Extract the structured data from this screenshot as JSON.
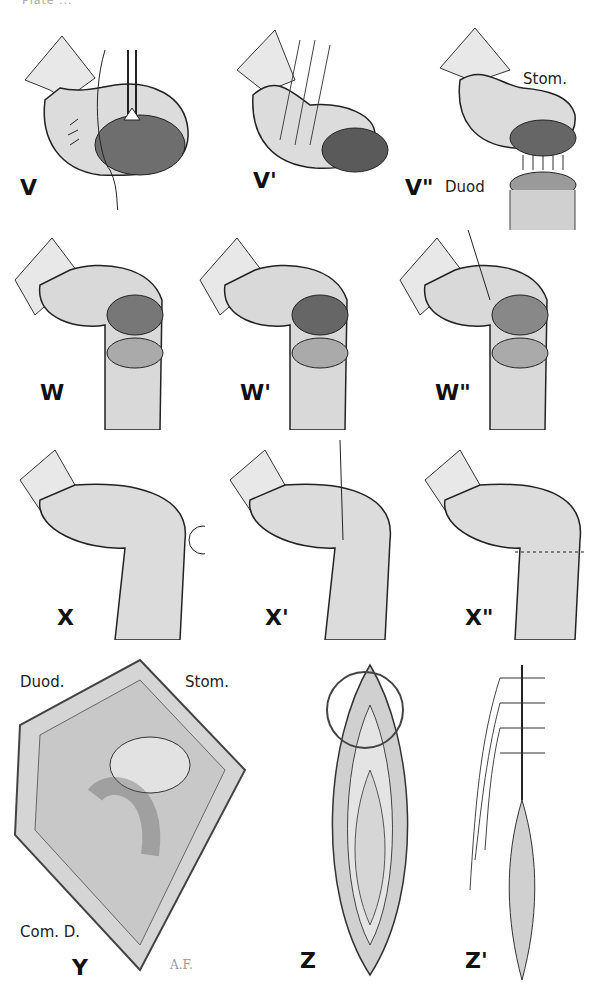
{
  "header": {
    "text": "Plate ..."
  },
  "figures": {
    "V": {
      "label": "V"
    },
    "V1": {
      "label": "V'"
    },
    "V2": {
      "label": "V\"",
      "annotations": [
        "Stom.",
        "Duod"
      ]
    },
    "W": {
      "label": "W"
    },
    "W1": {
      "label": "W'"
    },
    "W2": {
      "label": "W\""
    },
    "X": {
      "label": "X"
    },
    "X1": {
      "label": "X'"
    },
    "X2": {
      "label": "X\""
    },
    "Y": {
      "label": "Y",
      "annotations": [
        "Duod.",
        "Stom.",
        "Com. D."
      ],
      "signature": "A.F."
    },
    "Z": {
      "label": "Z"
    },
    "Z1": {
      "label": "Z'"
    }
  },
  "colors": {
    "ink": "#111111",
    "tissue": "#d9d9d9",
    "shadow": "#9a9a9a",
    "paper": "#ffffff"
  }
}
